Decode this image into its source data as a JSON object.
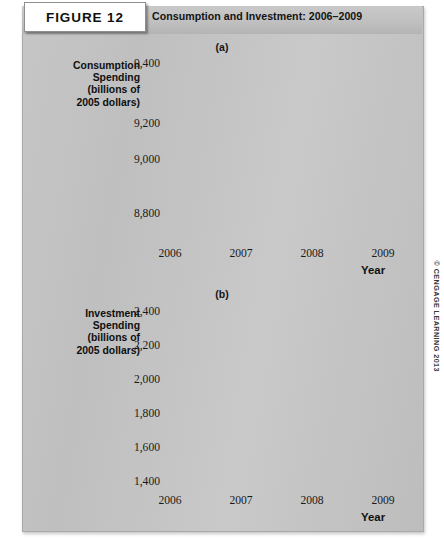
{
  "figure": {
    "badge_label": "FIGURE 12",
    "title": "Consumption and Investment: 2006–2009",
    "credit": "© CENGAGE LEARNING 2013",
    "panel_bg": "#c4c4c4",
    "plot_bg": "#ffffff",
    "recession_shade": "#c3c3c3",
    "line_color": "#1a1a1a",
    "grid_color": "#9a9a9a"
  },
  "chart_data": [
    {
      "type": "line",
      "id": "panel-a",
      "title": "(a)",
      "ylabel": "Consumption Spending (billions of 2005 dollars)",
      "ylabel_lines": [
        "Consumption",
        "Spending",
        "(billions of",
        "2005 dollars)"
      ],
      "xlabel": "Year",
      "ytick_labels": [
        "9,400",
        "9,200",
        "9,000",
        "8,800"
      ],
      "ytick_values": [
        9400,
        9200,
        9000,
        8800
      ],
      "ylim": [
        8800,
        9400
      ],
      "axis_break": true,
      "xtick_labels": [
        "2006",
        "2007",
        "2008",
        "2009"
      ],
      "xtick_values": [
        2006,
        2007,
        2008,
        2009
      ],
      "xlim": [
        2006,
        2009.5
      ],
      "grid": true,
      "minor_gridlines_per_year": 4,
      "shaded_region": {
        "label": "recession",
        "from": 2008,
        "to": 2009.5
      },
      "x": [
        2006.125,
        2006.375,
        2006.625,
        2006.875,
        2007.125,
        2007.375,
        2007.625,
        2007.875,
        2008.125,
        2008.375,
        2008.625,
        2008.875,
        2009.125,
        2009.375
      ],
      "values": [
        8968,
        9032,
        9105,
        9150,
        9180,
        9220,
        9265,
        9305,
        9285,
        9282,
        9225,
        9120,
        9065,
        9010
      ]
    },
    {
      "type": "line",
      "id": "panel-b",
      "title": "(b)",
      "ylabel": "Investment Spending (billions of 2005 dollars)",
      "ylabel_lines": [
        "Investment",
        "Spending",
        "(billions of",
        "2005 dollars)"
      ],
      "xlabel": "Year",
      "ytick_labels": [
        "2,400",
        "2,200",
        "2,000",
        "1,800",
        "1,600",
        "1,400"
      ],
      "ytick_values": [
        2400,
        2200,
        2000,
        1800,
        1600,
        1400
      ],
      "ylim": [
        1400,
        2400
      ],
      "axis_break": true,
      "xtick_labels": [
        "2006",
        "2007",
        "2008",
        "2009"
      ],
      "xtick_values": [
        2006,
        2007,
        2008,
        2009
      ],
      "xlim": [
        2006,
        2009.5
      ],
      "grid": true,
      "minor_gridlines_per_year": 4,
      "shaded_region": {
        "label": "recession",
        "from": 2008,
        "to": 2009.5
      },
      "x": [
        2006.125,
        2006.375,
        2006.625,
        2006.875,
        2007.125,
        2007.375,
        2007.625,
        2007.875,
        2008.125,
        2008.375,
        2008.625,
        2008.875,
        2009.125,
        2009.375
      ],
      "values": [
        2280,
        2272,
        2240,
        2208,
        2188,
        2196,
        2182,
        2150,
        2100,
        2070,
        2030,
        1880,
        1560,
        1420
      ]
    }
  ]
}
